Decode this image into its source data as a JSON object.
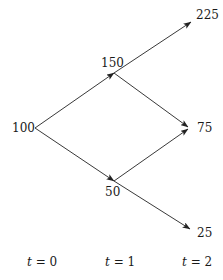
{
  "diagram": {
    "type": "binomial-tree",
    "nodes": [
      {
        "id": "n0",
        "label": "100",
        "time": 0,
        "x": 35,
        "y": 128,
        "label_x": 12,
        "label_y": 132,
        "anchor": "start"
      },
      {
        "id": "n1u",
        "label": "150",
        "time": 1,
        "x": 114,
        "y": 73,
        "label_x": 101,
        "label_y": 67,
        "anchor": "start"
      },
      {
        "id": "n1d",
        "label": "50",
        "time": 1,
        "x": 114,
        "y": 181,
        "label_x": 105,
        "label_y": 196,
        "anchor": "start"
      },
      {
        "id": "n2uu",
        "label": "225",
        "time": 2,
        "x": 191,
        "y": 22,
        "label_x": 196,
        "label_y": 19,
        "anchor": "start"
      },
      {
        "id": "n2ud",
        "label": "75",
        "time": 2,
        "x": 188,
        "y": 128,
        "label_x": 197,
        "label_y": 132,
        "anchor": "start"
      },
      {
        "id": "n2dd",
        "label": "25",
        "time": 2,
        "x": 190,
        "y": 229,
        "label_x": 197,
        "label_y": 237,
        "anchor": "start"
      }
    ],
    "edges": [
      {
        "from": "n0",
        "to": "n1u",
        "x1": 35,
        "y1": 128,
        "x2": 114,
        "y2": 73
      },
      {
        "from": "n1u",
        "to": "n2uu",
        "x1": 114,
        "y1": 73,
        "x2": 191,
        "y2": 22
      },
      {
        "from": "n1u",
        "to": "n2ud",
        "x1": 114,
        "y1": 73,
        "x2": 188,
        "y2": 127
      },
      {
        "from": "n0",
        "to": "n1d",
        "x1": 35,
        "y1": 128,
        "x2": 114,
        "y2": 181
      },
      {
        "from": "n1d",
        "to": "n2ud",
        "x1": 114,
        "y1": 181,
        "x2": 188,
        "y2": 129
      },
      {
        "from": "n1d",
        "to": "n2dd",
        "x1": 114,
        "y1": 181,
        "x2": 190,
        "y2": 229
      }
    ],
    "time_axis": [
      {
        "var": "t",
        "eq": " = ",
        "value": "0",
        "x": 27,
        "y": 266
      },
      {
        "var": "t",
        "eq": " = ",
        "value": "1",
        "x": 105,
        "y": 266
      },
      {
        "var": "t",
        "eq": " = ",
        "value": "2",
        "x": 182,
        "y": 266
      }
    ],
    "colors": {
      "line": "#222222",
      "text": "#1a1a1a",
      "background": "#ffffff"
    }
  }
}
